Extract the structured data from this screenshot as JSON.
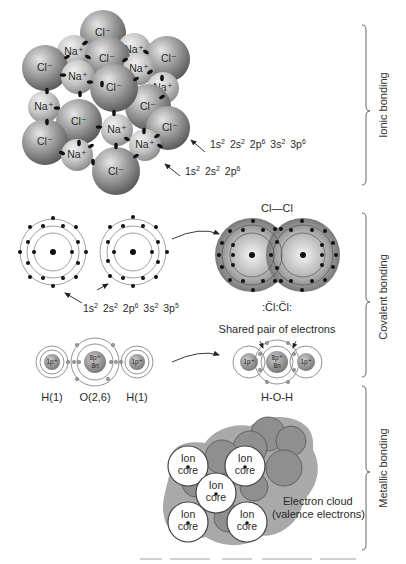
{
  "sections": [
    {
      "id": "ionic",
      "label": "Ionic bonding",
      "ions": {
        "anion": "Cl⁻",
        "cation": "Na⁺"
      },
      "configs": [
        {
          "id": "cl_config",
          "base": [
            "1s",
            "2s",
            "2p",
            "3s",
            "3p"
          ],
          "exp": [
            "2",
            "2",
            "6",
            "2",
            "6"
          ]
        },
        {
          "id": "na_config",
          "base": [
            "1s",
            "2s",
            "2p"
          ],
          "exp": [
            "2",
            "2",
            "6"
          ]
        }
      ]
    },
    {
      "id": "covalent",
      "label": "Covalent bonding",
      "molecule_label": "Cl—Cl",
      "lewis_label": ":C̈l:C̈l:",
      "atom_config": {
        "base": [
          "1s",
          "2s",
          "2p",
          "3s",
          "3p"
        ],
        "exp": [
          "2",
          "2",
          "6",
          "2",
          "5"
        ]
      },
      "shared_pair_label": "Shared pair of electrons",
      "water": {
        "atoms": [
          "H(1)",
          "O(2,6)",
          "H(1)"
        ],
        "h_nucleus": "1p⁺",
        "o_nucleus_p": "8p⁺",
        "o_nucleus_n": "8n",
        "molecule_label": "H-O-H"
      }
    },
    {
      "id": "metallic",
      "label": "Metallic bonding",
      "ion_core_line1": "Ion",
      "ion_core_line2": "core",
      "cloud_label_line1": "Electron cloud",
      "cloud_label_line2": "(valence electrons)"
    }
  ],
  "colors": {
    "sphere_dark": "#5e5e5e",
    "sphere_light": "#d8d8d8",
    "cloud": "#a9a9a9",
    "ink": "#222222"
  }
}
